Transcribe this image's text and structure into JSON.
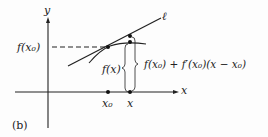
{
  "figure": {
    "panel_label": "(b)",
    "axes": {
      "x_label": "x",
      "y_label": "y"
    },
    "tangent_label": "ℓ",
    "points": {
      "x0": "x₀",
      "x": "x"
    },
    "labels": {
      "f_x0": "f(x₀)",
      "f_x": "f(x)",
      "linear_approx": "f(x₀) + f′(x₀)(x − x₀)"
    }
  }
}
